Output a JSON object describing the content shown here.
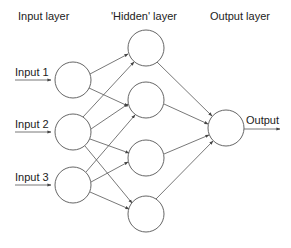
{
  "diagram": {
    "type": "neural-network",
    "layer_titles": {
      "input": "Input layer",
      "hidden": "'Hidden' layer",
      "output": "Output layer"
    },
    "inputs": [
      {
        "label": "Input 1"
      },
      {
        "label": "Input 2"
      },
      {
        "label": "Input 3"
      }
    ],
    "output_label": "Output",
    "layers": {
      "input_count": 3,
      "hidden_count": 4,
      "output_count": 1
    },
    "connections": "fully-connected input→hidden→output",
    "colors": {
      "line": "#555555",
      "text": "#222222",
      "background": "#ffffff"
    }
  }
}
